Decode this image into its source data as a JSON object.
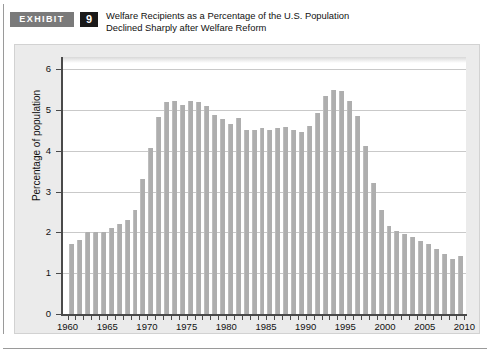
{
  "header": {
    "tag_label": "EXHIBIT",
    "number": "9",
    "title_line1": "Welfare Recipients as a Percentage of the U.S. Population",
    "title_line2": "Declined Sharply after Welfare Reform"
  },
  "colors": {
    "bar": "#aeaeae",
    "panel_bg": "#ebebeb",
    "plot_bg": "#ffffff",
    "grid": "#c9c9c9",
    "axis": "#4a4a4a",
    "tag_bg": "#7a7a7a",
    "number_bg": "#1a1a1a"
  },
  "chart_data": {
    "type": "bar",
    "title": "Welfare Recipients as a Percentage of the U.S. Population Declined Sharply after Welfare Reform",
    "xlabel": "",
    "ylabel": "Percentage of population",
    "ylim": [
      0,
      6.3
    ],
    "xlim": [
      1959.3,
      2010.2
    ],
    "grid": true,
    "legend": "none",
    "y_ticks": [
      0,
      1,
      2,
      3,
      4,
      5,
      6
    ],
    "y_tick_labels": [
      "0",
      "1",
      "2",
      "3",
      "4",
      "5",
      "6"
    ],
    "x_tick_labels": [
      "1960",
      "1965",
      "1970",
      "1975",
      "1980",
      "1985",
      "1990",
      "1995",
      "2000",
      "2005",
      "2010"
    ],
    "x_tick_values": [
      1960,
      1965,
      1970,
      1975,
      1980,
      1985,
      1990,
      1995,
      2000,
      2005,
      2010
    ],
    "categories": [
      1960,
      1961,
      1962,
      1963,
      1964,
      1965,
      1966,
      1967,
      1968,
      1969,
      1970,
      1971,
      1972,
      1973,
      1974,
      1975,
      1976,
      1977,
      1978,
      1979,
      1980,
      1981,
      1982,
      1983,
      1984,
      1985,
      1986,
      1987,
      1988,
      1989,
      1990,
      1991,
      1992,
      1993,
      1994,
      1995,
      1996,
      1997,
      1998,
      1999,
      2000,
      2001,
      2002,
      2003,
      2004,
      2005,
      2006,
      2007,
      2008,
      2009
    ],
    "values": [
      1.72,
      1.81,
      2.0,
      2.0,
      2.0,
      2.1,
      2.2,
      2.3,
      2.55,
      3.32,
      4.07,
      4.82,
      5.2,
      5.22,
      5.12,
      5.22,
      5.2,
      5.1,
      4.87,
      4.78,
      4.65,
      4.8,
      4.5,
      4.52,
      4.55,
      4.5,
      4.57,
      4.58,
      4.5,
      4.45,
      4.62,
      4.93,
      5.34,
      5.5,
      5.46,
      5.21,
      4.85,
      4.12,
      3.2,
      2.55,
      2.16,
      2.03,
      1.97,
      1.9,
      1.8,
      1.72,
      1.6,
      1.48,
      1.35,
      1.42
    ]
  }
}
